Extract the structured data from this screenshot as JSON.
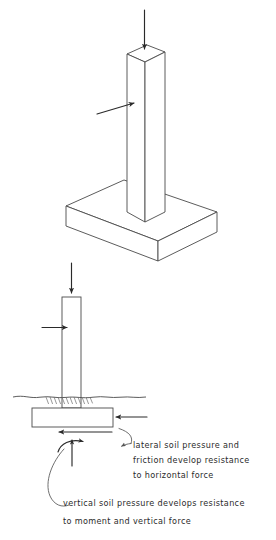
{
  "figure": {
    "background_color": "#ffffff",
    "line_color": "#3b3b3b",
    "text_color": "#2b2b2b"
  },
  "top_view": {
    "name": "isometric pedestal on spread footing",
    "vertical_load_arrow_label": "",
    "horizontal_force_arrow_label": ""
  },
  "bottom_view": {
    "name": "elevation of footing below grade",
    "ground_line_label": "",
    "vertical_load_arrow_label": "",
    "horizontal_force_arrow_label": "",
    "lateral_pressure_arrow_label": "",
    "friction_arrow_label": "",
    "bearing_arrow_label": "",
    "moment_arc_label": ""
  },
  "annotations": [
    {
      "id": "lateral-note",
      "lines": [
        "lateral soil pressure and",
        "friction develop resistance",
        "to horizontal force"
      ]
    },
    {
      "id": "vertical-note",
      "lines": [
        "vertical soil pressure develops resistance",
        "to moment and vertical force"
      ]
    }
  ]
}
